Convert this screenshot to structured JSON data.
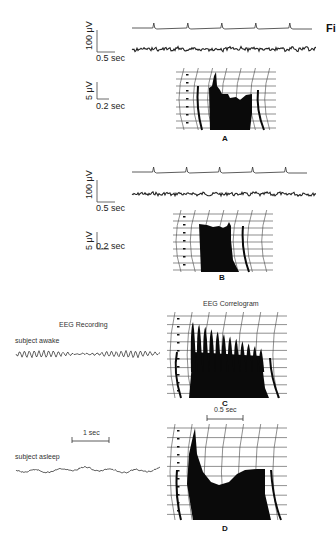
{
  "figure": {
    "edge_fragment": "Fi",
    "panels": [
      {
        "id": "A",
        "letter": "A",
        "trace_scale": {
          "amplitude": "100 μV",
          "time": "0.5 sec"
        },
        "correlogram_scale": {
          "amplitude": "5 μV",
          "time": "0.2 sec"
        },
        "marker_pulses": 5
      },
      {
        "id": "B",
        "letter": "B",
        "trace_scale": {
          "amplitude": "100 μV",
          "time": "0.5 sec"
        },
        "correlogram_scale": {
          "amplitude": "5 μV",
          "time": "0.2 sec"
        },
        "marker_pulses": 5
      },
      {
        "id": "C",
        "letter": "C",
        "left_heading": "EEG Recording",
        "right_heading": "EEG Correlogram",
        "trace_label": "subject awake",
        "correlogram_scale_bar": "0.5 sec"
      },
      {
        "id": "D",
        "letter": "D",
        "trace_label": "subject asleep",
        "trace_scale_bar": "1 sec"
      }
    ]
  }
}
